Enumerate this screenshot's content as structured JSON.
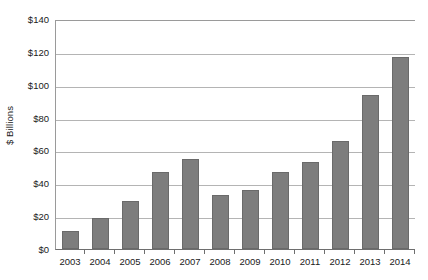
{
  "chart_data": {
    "type": "bar",
    "title": "",
    "subtitle": "",
    "xlabel": "",
    "ylabel": "$ Billions",
    "categories": [
      "2003",
      "2004",
      "2005",
      "2006",
      "2007",
      "2008",
      "2009",
      "2010",
      "2011",
      "2012",
      "2013",
      "2014"
    ],
    "values": [
      11,
      19,
      29,
      47,
      55,
      33,
      36,
      47,
      53,
      66,
      94,
      117
    ],
    "series": [
      {
        "name": "",
        "values": [
          11,
          19,
          29,
          47,
          55,
          33,
          36,
          47,
          53,
          66,
          94,
          117
        ]
      }
    ],
    "ylim": [
      0,
      140
    ],
    "y_ticks": [
      0,
      20,
      40,
      60,
      80,
      100,
      120,
      140
    ],
    "y_tick_labels": [
      "$0",
      "$20",
      "$40",
      "$60",
      "$80",
      "$100",
      "$120",
      "$140"
    ],
    "grid": true,
    "grid_axis": "y",
    "legend": false,
    "legend_position": "none",
    "bar_color": "#7d7d7d",
    "bar_edge_color": "#6a6a6a",
    "gridline_color": "#b4b4b4",
    "axis_color": "#6e6e6e",
    "background_color": "#ffffff",
    "text_color": "#1a1a1a"
  }
}
